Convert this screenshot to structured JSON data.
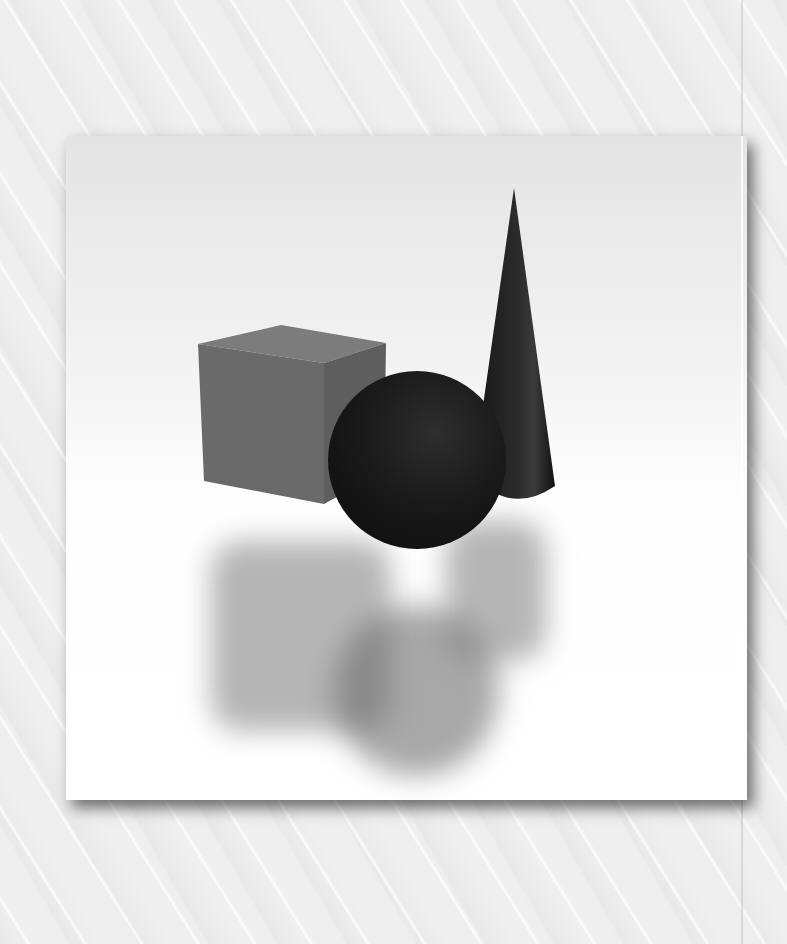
{
  "scene": {
    "description": "3D render of geometric primitives on a white card",
    "objects": [
      {
        "name": "cube",
        "color": "#6e6e6e"
      },
      {
        "name": "sphere",
        "color": "#1a1a1a"
      },
      {
        "name": "cone",
        "color": "#222222"
      }
    ],
    "background_color": "#eeeeee",
    "card_color": "#ffffff"
  }
}
